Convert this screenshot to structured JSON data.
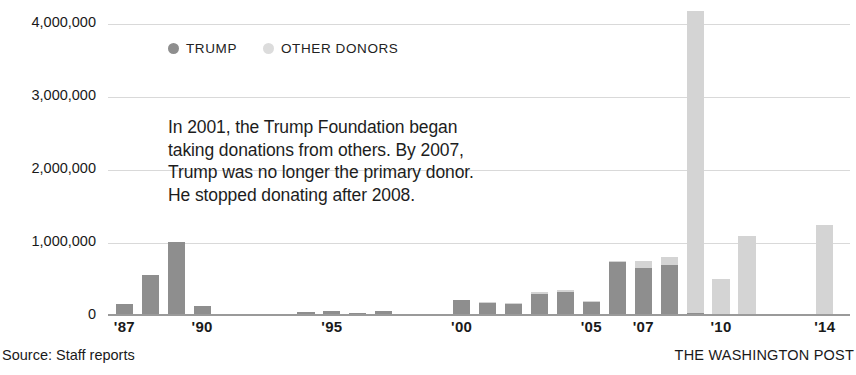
{
  "chart_data": {
    "type": "bar",
    "title": "",
    "subtitle": "",
    "xlabel": "",
    "ylabel": "",
    "stacked": true,
    "grid": true,
    "legend_position": "top-left-inside",
    "ylim": [
      0,
      4250000
    ],
    "y_ticks": [
      "0",
      "1,000,000",
      "2,000,000",
      "3,000,000",
      "4,000,000"
    ],
    "y_tick_values": [
      0,
      1000000,
      2000000,
      3000000,
      4000000
    ],
    "x_tick_labels": [
      "'87",
      "'90",
      "'95",
      "'00",
      "'05",
      "'07",
      "'10",
      "'14"
    ],
    "x_tick_years": [
      1987,
      1990,
      1995,
      2000,
      2005,
      2007,
      2010,
      2014
    ],
    "categories": [
      1987,
      1988,
      1989,
      1990,
      1991,
      1992,
      1993,
      1994,
      1995,
      1996,
      1997,
      1998,
      1999,
      2000,
      2001,
      2002,
      2003,
      2004,
      2005,
      2006,
      2007,
      2008,
      2009,
      2010,
      2011,
      2012,
      2013,
      2014
    ],
    "series": [
      {
        "name": "TRUMP",
        "color": "#8e8e8e",
        "values": [
          160000,
          560000,
          1010000,
          135000,
          0,
          0,
          0,
          60000,
          65000,
          0,
          75000,
          0,
          0,
          225000,
          180000,
          170000,
          300000,
          330000,
          200000,
          740000,
          660000,
          700000,
          35000,
          0,
          0,
          0,
          0,
          0
        ]
      },
      {
        "name": "OTHER DONORS",
        "color": "#d4d4d4",
        "values": [
          0,
          0,
          0,
          0,
          0,
          0,
          0,
          0,
          0,
          0,
          0,
          0,
          0,
          0,
          0,
          0,
          0,
          30000,
          0,
          20000,
          90000,
          110000,
          4145000,
          510000,
          1100000,
          20000,
          15000,
          1250000
        ]
      }
    ],
    "series_flat_note": "",
    "bars": [
      {
        "year": 1987,
        "trump": 160000,
        "other": 0
      },
      {
        "year": 1988,
        "trump": 560000,
        "other": 0
      },
      {
        "year": 1989,
        "trump": 1010000,
        "other": 0
      },
      {
        "year": 1990,
        "trump": 135000,
        "other": 0
      },
      {
        "year": 1991,
        "trump": 0,
        "other": 0
      },
      {
        "year": 1992,
        "trump": 0,
        "other": 0
      },
      {
        "year": 1993,
        "trump": 0,
        "other": 0
      },
      {
        "year": 1994,
        "trump": 60000,
        "other": 0
      },
      {
        "year": 1995,
        "trump": 65000,
        "other": 0
      },
      {
        "year": 1996,
        "trump": 40000,
        "other": 0
      },
      {
        "year": 1997,
        "trump": 75000,
        "other": 0
      },
      {
        "year": 1998,
        "trump": 10000,
        "other": 0
      },
      {
        "year": 1999,
        "trump": 15000,
        "other": 0
      },
      {
        "year": 2000,
        "trump": 225000,
        "other": 0
      },
      {
        "year": 2001,
        "trump": 180000,
        "other": 10000
      },
      {
        "year": 2002,
        "trump": 170000,
        "other": 10000
      },
      {
        "year": 2003,
        "trump": 300000,
        "other": 25000
      },
      {
        "year": 2004,
        "trump": 330000,
        "other": 30000
      },
      {
        "year": 2005,
        "trump": 200000,
        "other": 10000
      },
      {
        "year": 2006,
        "trump": 740000,
        "other": 20000
      },
      {
        "year": 2007,
        "trump": 660000,
        "other": 90000
      },
      {
        "year": 2008,
        "trump": 700000,
        "other": 110000
      },
      {
        "year": 2009,
        "trump": 35000,
        "other": 4145000
      },
      {
        "year": 2010,
        "trump": 0,
        "other": 510000
      },
      {
        "year": 2011,
        "trump": 0,
        "other": 1100000
      },
      {
        "year": 2012,
        "trump": 0,
        "other": 20000
      },
      {
        "year": 2013,
        "trump": 0,
        "other": 15000
      },
      {
        "year": 2014,
        "trump": 0,
        "other": 1250000
      }
    ],
    "peak": {
      "year": 2009,
      "value": 4180000,
      "label": ""
    },
    "annotation": "In 2001, the Trump Foundation began taking donations from others. By 2007, Trump was no longer the primary donor. He stopped donating after 2008."
  },
  "legend": {
    "items": [
      {
        "label": "TRUMP",
        "color": "#8e8e8e",
        "icon": "dot-icon"
      },
      {
        "label": "OTHER DONORS",
        "color": "#dcdcdc",
        "icon": "dot-icon"
      }
    ]
  },
  "footer": {
    "source": "Source: Staff reports",
    "credit": "THE WASHINGTON POST"
  },
  "colors": {
    "trump": "#8e8e8e",
    "other": "#d4d4d4",
    "grid": "#d9d9d9",
    "axis": "#9a9a9a",
    "text": "#1a1a1a",
    "background": "#ffffff"
  }
}
